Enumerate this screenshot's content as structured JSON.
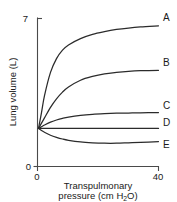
{
  "chart_data": {
    "type": "line",
    "title": "",
    "xlabel": "Transpulmonary pressure (cm H2O)",
    "xlabel_line1": "Transpulmonary",
    "xlabel_line2_pre": "pressure (cm H",
    "xlabel_line2_sub": "2",
    "xlabel_line2_post": "O)",
    "ylabel": "Lung volume (L)",
    "xlim": [
      0,
      40
    ],
    "ylim": [
      0,
      7
    ],
    "xticks": [
      "0",
      "40"
    ],
    "yticks": [
      "0",
      "7"
    ],
    "grid": false,
    "legend_position": "right-of-curve-ends",
    "x": [
      0,
      1,
      2,
      4,
      6,
      8,
      10,
      14,
      18,
      22,
      26,
      30,
      34,
      40
    ],
    "series": [
      {
        "name": "A",
        "label": "A",
        "values": [
          1.8,
          2.55,
          3.35,
          4.45,
          5.1,
          5.5,
          5.75,
          6.05,
          6.25,
          6.38,
          6.48,
          6.55,
          6.6,
          6.65
        ]
      },
      {
        "name": "B",
        "label": "B",
        "values": [
          1.8,
          2.05,
          2.3,
          2.8,
          3.2,
          3.52,
          3.76,
          4.08,
          4.26,
          4.38,
          4.45,
          4.5,
          4.53,
          4.55
        ]
      },
      {
        "name": "C",
        "label": "C",
        "values": [
          1.8,
          1.88,
          1.96,
          2.1,
          2.2,
          2.28,
          2.34,
          2.42,
          2.47,
          2.5,
          2.52,
          2.53,
          2.54,
          2.55
        ]
      },
      {
        "name": "D",
        "label": "D",
        "values": [
          1.8,
          1.8,
          1.8,
          1.8,
          1.8,
          1.8,
          1.8,
          1.8,
          1.8,
          1.8,
          1.8,
          1.8,
          1.8,
          1.8
        ]
      },
      {
        "name": "E",
        "label": "E",
        "values": [
          1.8,
          1.7,
          1.62,
          1.48,
          1.38,
          1.3,
          1.24,
          1.16,
          1.12,
          1.1,
          1.1,
          1.12,
          1.14,
          1.18
        ]
      }
    ]
  },
  "axes": {
    "y_tick_top": "7",
    "y_tick_bottom": "0",
    "x_tick_left": "0",
    "x_tick_right": "40"
  },
  "colors": {
    "curve": "#2b2b2b",
    "axis": "#4a4a4a",
    "text": "#1a1a1a",
    "background": "#ffffff"
  }
}
